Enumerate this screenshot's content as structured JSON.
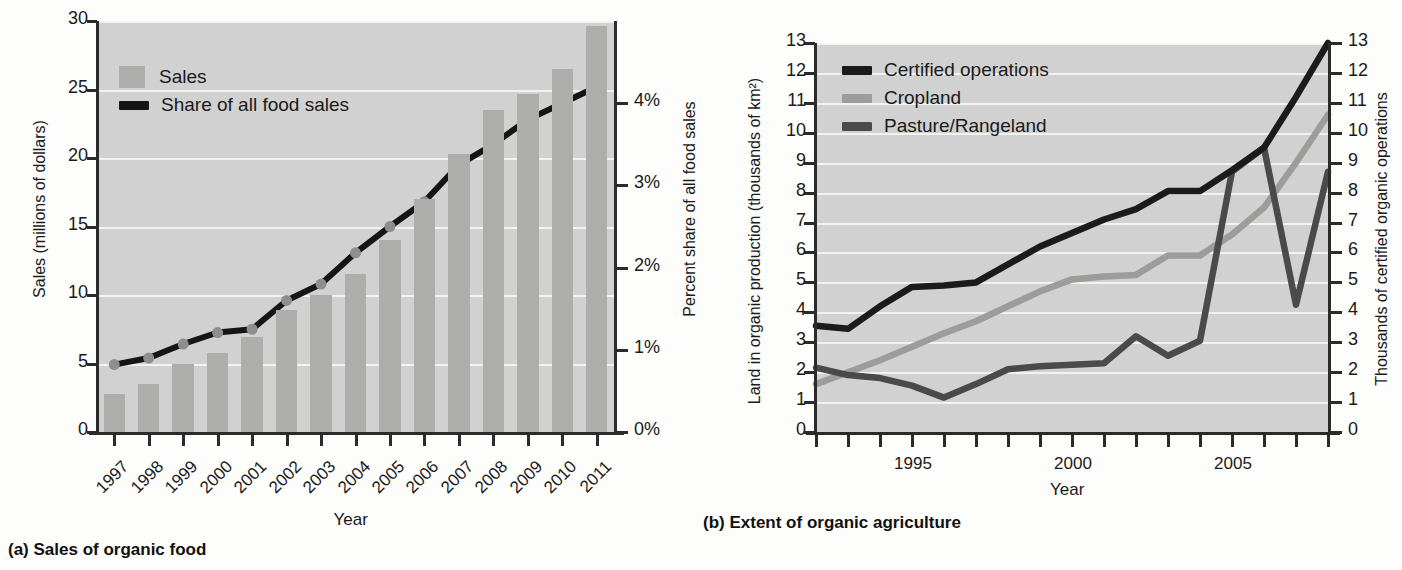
{
  "chart_data": [
    {
      "type": "bar",
      "panel_label": "(a)",
      "title": "(a) Sales of organic food",
      "xlabel": "Year",
      "ylabel": "Sales (millions of dollars)",
      "ylabel_right": "Percent share of all food sales",
      "categories": [
        "1997",
        "1998",
        "1999",
        "2000",
        "2001",
        "2002",
        "2003",
        "2004",
        "2005",
        "2006",
        "2007",
        "2008",
        "2009",
        "2010",
        "2011"
      ],
      "ylim": [
        0,
        30
      ],
      "yticks": [
        "0",
        "5",
        "10",
        "15",
        "20",
        "25",
        "30"
      ],
      "ylim_right": [
        0,
        5
      ],
      "yticks_right": [
        "0%",
        "1%",
        "2%",
        "3%",
        "4%"
      ],
      "grid": true,
      "legend_position": "top-left",
      "series": [
        {
          "name": "Sales",
          "kind": "bar",
          "axis": "left",
          "color": "#adaeab",
          "values": [
            2.8,
            3.5,
            5.0,
            5.8,
            6.9,
            8.9,
            10.0,
            11.5,
            14.0,
            17.0,
            20.3,
            23.5,
            24.7,
            26.5,
            29.6
          ]
        },
        {
          "name": "Share of all food sales",
          "kind": "line",
          "axis": "right",
          "color": "#151515",
          "marker_color": "#8e8f8c",
          "values": [
            0.82,
            0.9,
            1.07,
            1.21,
            1.25,
            1.6,
            1.8,
            2.18,
            2.5,
            2.8,
            3.25,
            3.5,
            3.8,
            4.0,
            4.2
          ]
        }
      ]
    },
    {
      "type": "line",
      "panel_label": "(b)",
      "title": "(b) Extent of organic agriculture",
      "xlabel": "Year",
      "ylabel": "Land in organic production (thousands of km²)",
      "ylabel_right": "Thousands of certified organic operations",
      "x": [
        1992,
        1993,
        1994,
        1995,
        1996,
        1997,
        1998,
        1999,
        2000,
        2001,
        2002,
        2003,
        2004,
        2005,
        2006,
        2007,
        2008
      ],
      "xticklabels": [
        "1995",
        "2000",
        "2005"
      ],
      "xtick_values": [
        1995,
        2000,
        2005
      ],
      "xlim": [
        1992,
        2008
      ],
      "ylim": [
        0,
        13
      ],
      "yticks": [
        "0",
        "1",
        "2",
        "3",
        "4",
        "5",
        "6",
        "7",
        "8",
        "9",
        "10",
        "11",
        "12",
        "13"
      ],
      "ylim_right": [
        0,
        13
      ],
      "yticks_right": [
        "0",
        "1",
        "2",
        "3",
        "4",
        "5",
        "6",
        "7",
        "8",
        "9",
        "10",
        "11",
        "12",
        "13"
      ],
      "grid": true,
      "legend_position": "top-left",
      "series": [
        {
          "name": "Certified operations",
          "axis": "right",
          "color": "#1b1b1b",
          "values": [
            3.55,
            3.45,
            4.2,
            4.85,
            4.9,
            5.0,
            5.6,
            6.2,
            6.65,
            7.1,
            7.45,
            8.05,
            8.05,
            8.75,
            9.5,
            11.2,
            13.0
          ]
        },
        {
          "name": "Cropland",
          "axis": "left",
          "color": "#9c9d9a",
          "values": [
            1.6,
            2.0,
            2.4,
            2.85,
            3.3,
            3.7,
            4.2,
            4.7,
            5.1,
            5.2,
            5.25,
            5.9,
            5.9,
            6.6,
            7.5,
            9.0,
            10.6
          ]
        },
        {
          "name": "Pasture/Rangeland",
          "axis": "left",
          "color": "#4a4a4a",
          "values": [
            2.15,
            1.9,
            1.8,
            1.55,
            1.15,
            1.6,
            2.1,
            2.2,
            2.25,
            2.3,
            3.2,
            2.55,
            3.05,
            8.7,
            9.5,
            4.25,
            8.7
          ]
        }
      ]
    }
  ],
  "panel_a": {
    "caption": "(a) Sales of organic food",
    "xaxis_title": "Year",
    "yaxis_title": "Sales (millions of dollars)",
    "yaxis_right_title": "Percent share of all food sales",
    "legend": [
      {
        "label": "Sales",
        "type": "box"
      },
      {
        "label": "Share of all food sales",
        "type": "line"
      }
    ],
    "yticks": [
      "30",
      "25",
      "20",
      "15",
      "10",
      "5",
      "0"
    ],
    "yticks_right": [
      "4%",
      "3%",
      "2%",
      "1%",
      "0%"
    ],
    "xticks": [
      "1997",
      "1998",
      "1999",
      "2000",
      "2001",
      "2002",
      "2003",
      "2004",
      "2005",
      "2006",
      "2007",
      "2008",
      "2009",
      "2010",
      "2011"
    ]
  },
  "panel_b": {
    "caption": "(b) Extent of organic agriculture",
    "xaxis_title": "Year",
    "yaxis_title": "Land in organic production (thousands of km²)",
    "yaxis_right_title": "Thousands of certified organic operations",
    "legend": [
      {
        "label": "Certified operations",
        "type": "line"
      },
      {
        "label": "Cropland",
        "type": "line"
      },
      {
        "label": "Pasture/Rangeland",
        "type": "line"
      }
    ],
    "yticks": [
      "13",
      "12",
      "11",
      "10",
      "9",
      "8",
      "7",
      "6",
      "5",
      "4",
      "3",
      "2",
      "1",
      "0"
    ],
    "yticks_right": [
      "13",
      "12",
      "11",
      "10",
      "9",
      "8",
      "7",
      "6",
      "5",
      "4",
      "3",
      "2",
      "1",
      "0"
    ],
    "xticks": [
      "1995",
      "2000",
      "2005"
    ]
  },
  "colors": {
    "plot_background": "#d0d1d0",
    "gridline": "#f2f2f0",
    "bar": "#adaeab",
    "axis": "#2b2b2b",
    "series_dark": "#1b1b1b",
    "series_mid": "#4a4a4a",
    "series_light": "#9c9d9a"
  }
}
